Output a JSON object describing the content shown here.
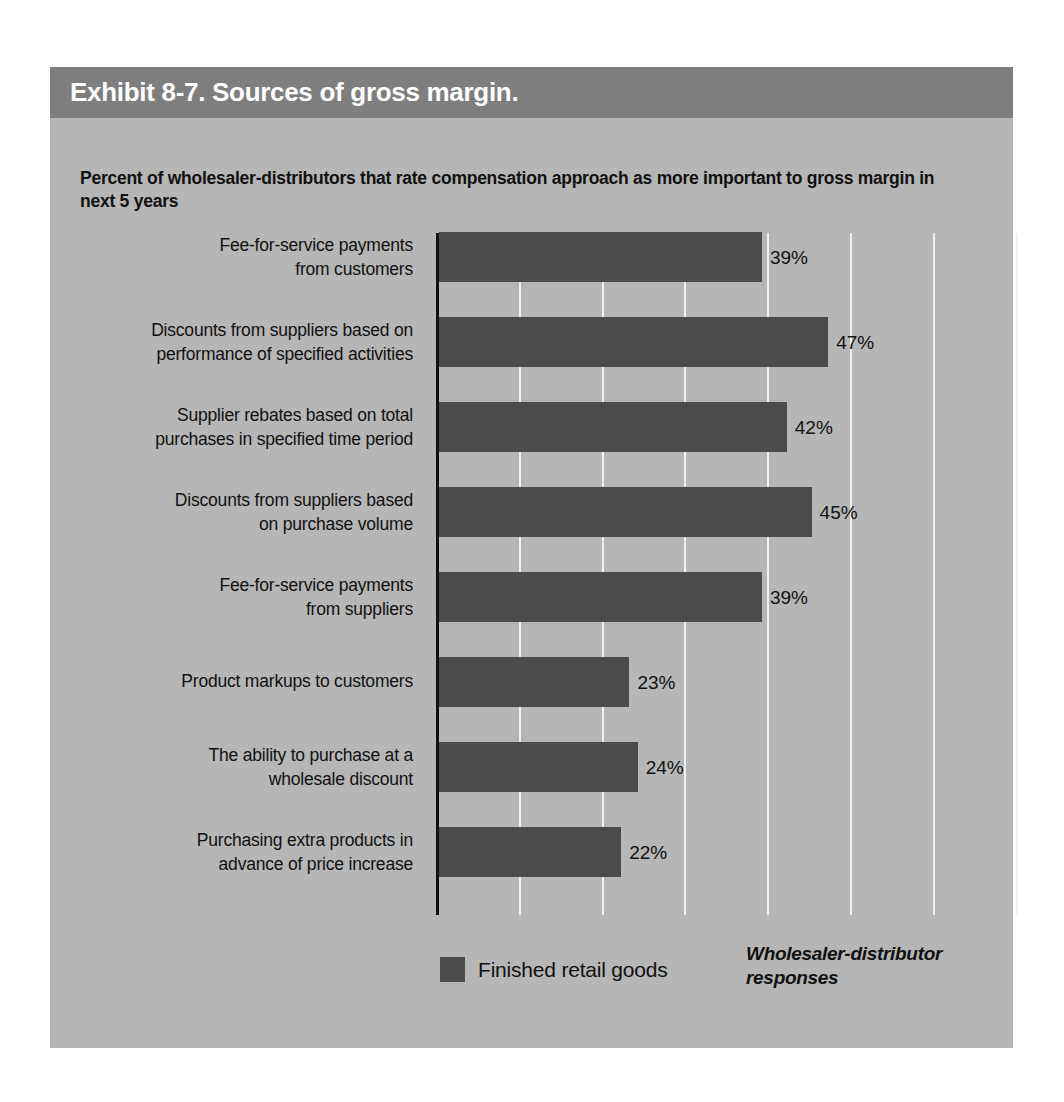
{
  "exhibit": {
    "title": "Exhibit 8-7. Sources of gross margin.",
    "subtitle": "Percent of wholesaler-distributors that rate compensation approach as more important to gross margin in next 5 years",
    "source_note": "Wholesaler-distributor responses",
    "colors": {
      "panel_background": "#b6b6b6",
      "title_bar": "#7e7e7e",
      "title_text": "#ffffff",
      "bar_fill": "#4b4b4b",
      "gridline": "#f0f0f0",
      "axis_line": "#111111",
      "body_text": "#111111"
    }
  },
  "chart_data": {
    "type": "bar",
    "orientation": "horizontal",
    "title": "Exhibit 8-7. Sources of gross margin.",
    "subtitle": "Percent of wholesaler-distributors that rate compensation approach as more important to gross margin in next 5 years",
    "xlabel": "",
    "ylabel": "",
    "xlim": [
      0,
      80
    ],
    "xtick_interval": 10,
    "grid": "vertical",
    "grid_values": [
      10,
      20,
      30,
      40,
      50,
      60,
      70,
      80
    ],
    "tick_labels_shown": false,
    "legend": [
      "Finished retail goods"
    ],
    "legend_position": "bottom-left",
    "annotation": "Wholesaler-distributor responses",
    "categories": [
      "Fee-for-service payments from customers",
      "Discounts from suppliers based on performance of specified activities",
      "Supplier rebates based on total purchases in specified time period",
      "Discounts from suppliers based on purchase volume",
      "Fee-for-service payments from suppliers",
      "Product markups to customers",
      "The ability to purchase at a wholesale discount",
      "Purchasing extra products in advance of price increase"
    ],
    "series": [
      {
        "name": "Finished retail goods",
        "values": [
          39,
          47,
          42,
          45,
          39,
          23,
          24,
          22
        ]
      }
    ],
    "bars": [
      {
        "label_line1": "Fee-for-service payments",
        "label_line2": "from customers",
        "value": 39,
        "value_label": "39%"
      },
      {
        "label_line1": "Discounts from suppliers based on",
        "label_line2": "performance of specified activities",
        "value": 47,
        "value_label": "47%"
      },
      {
        "label_line1": "Supplier rebates based on total",
        "label_line2": "purchases in specified time period",
        "value": 42,
        "value_label": "42%"
      },
      {
        "label_line1": "Discounts from suppliers based",
        "label_line2": "on purchase volume",
        "value": 45,
        "value_label": "45%"
      },
      {
        "label_line1": "Fee-for-service payments",
        "label_line2": "from suppliers",
        "value": 39,
        "value_label": "39%"
      },
      {
        "label_line1": "Product markups to customers",
        "label_line2": "",
        "value": 23,
        "value_label": "23%"
      },
      {
        "label_line1": "The ability to purchase at a",
        "label_line2": "wholesale discount",
        "value": 24,
        "value_label": "24%"
      },
      {
        "label_line1": "Purchasing extra products in",
        "label_line2": "advance of price increase",
        "value": 22,
        "value_label": "22%"
      }
    ]
  }
}
